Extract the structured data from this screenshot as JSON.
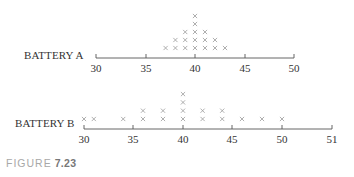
{
  "caption": {
    "word": "FIGURE",
    "number": "7.23"
  },
  "chart_data": [
    {
      "type": "dot",
      "title": "BATTERY A",
      "xlabel": "",
      "ylabel": "",
      "x_ticks": [
        30,
        35,
        40,
        45,
        50
      ],
      "x_tick_labels": [
        "30",
        "35",
        "40",
        "45",
        "50"
      ],
      "xlim": [
        30,
        50
      ],
      "grid": false,
      "marker": "x",
      "points": [
        {
          "x": 37,
          "count": 1
        },
        {
          "x": 38,
          "count": 2
        },
        {
          "x": 39,
          "count": 3
        },
        {
          "x": 40,
          "count": 5
        },
        {
          "x": 41,
          "count": 3
        },
        {
          "x": 42,
          "count": 2
        },
        {
          "x": 43,
          "count": 1
        }
      ]
    },
    {
      "type": "dot",
      "title": "BATTERY B",
      "xlabel": "",
      "ylabel": "",
      "x_ticks": [
        30,
        35,
        40,
        45,
        50,
        51
      ],
      "x_tick_labels": [
        "30",
        "35",
        "40",
        "45",
        "50",
        "51"
      ],
      "xlim": [
        30,
        51
      ],
      "grid": false,
      "marker": "x",
      "points": [
        {
          "x": 30,
          "count": 1
        },
        {
          "x": 31,
          "count": 1
        },
        {
          "x": 34,
          "count": 1
        },
        {
          "x": 36,
          "count": 2
        },
        {
          "x": 38,
          "count": 2
        },
        {
          "x": 40,
          "count": 4
        },
        {
          "x": 42,
          "count": 2
        },
        {
          "x": 44,
          "count": 2
        },
        {
          "x": 46,
          "count": 1
        },
        {
          "x": 48,
          "count": 1
        },
        {
          "x": 50,
          "count": 1
        }
      ]
    }
  ],
  "colors": {
    "marker": "#9a9a9a",
    "axis": "#555555",
    "text": "#333333"
  }
}
